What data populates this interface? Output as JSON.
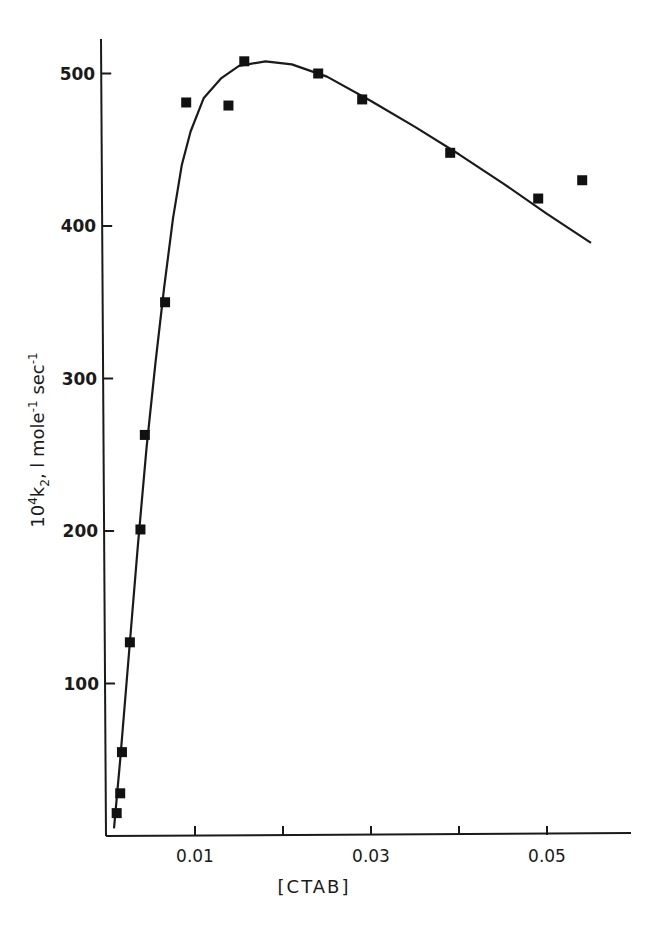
{
  "chart_data": {
    "type": "scatter",
    "title": "",
    "xlabel": "[CTAB]",
    "ylabel": "10^4 k2, l mole^-1 sec^-1",
    "ylabel_parts": {
      "base": "10",
      "exp": "4",
      "k": "k",
      "sub": "2",
      "rest1": ", l mole",
      "exp1": "-1",
      "rest2": " sec",
      "exp2": "-1"
    },
    "xlim": [
      0,
      0.06
    ],
    "ylim": [
      0,
      530
    ],
    "x_ticks": [
      0.01,
      0.02,
      0.03,
      0.04,
      0.05
    ],
    "x_tick_labels": [
      "0.01",
      "",
      "0.03",
      "",
      "0.05"
    ],
    "y_ticks": [
      100,
      200,
      300,
      400,
      500
    ],
    "y_tick_labels": [
      "100",
      "200",
      "300",
      "400",
      "500"
    ],
    "grid": false,
    "legend": null,
    "series": [
      {
        "name": "observed",
        "marker": "filled-square",
        "x": [
          0.0011,
          0.0015,
          0.0017,
          0.0026,
          0.0038,
          0.0043,
          0.0066,
          0.009,
          0.0138,
          0.0156,
          0.024,
          0.029,
          0.039,
          0.049,
          0.054
        ],
        "y": [
          15,
          28,
          55,
          127,
          201,
          263,
          350,
          481,
          479,
          508,
          500,
          483,
          448,
          418,
          430
        ]
      },
      {
        "name": "fitted curve",
        "style": "solid-line",
        "x": [
          0.0008,
          0.0015,
          0.0025,
          0.0035,
          0.0045,
          0.0055,
          0.0065,
          0.0075,
          0.0085,
          0.0095,
          0.011,
          0.013,
          0.015,
          0.018,
          0.021,
          0.025,
          0.03,
          0.035,
          0.04,
          0.045,
          0.05,
          0.055
        ],
        "y": [
          5,
          50,
          120,
          190,
          255,
          310,
          360,
          405,
          440,
          462,
          484,
          497,
          505,
          508,
          506,
          498,
          482,
          465,
          447,
          428,
          408,
          389
        ]
      }
    ]
  }
}
